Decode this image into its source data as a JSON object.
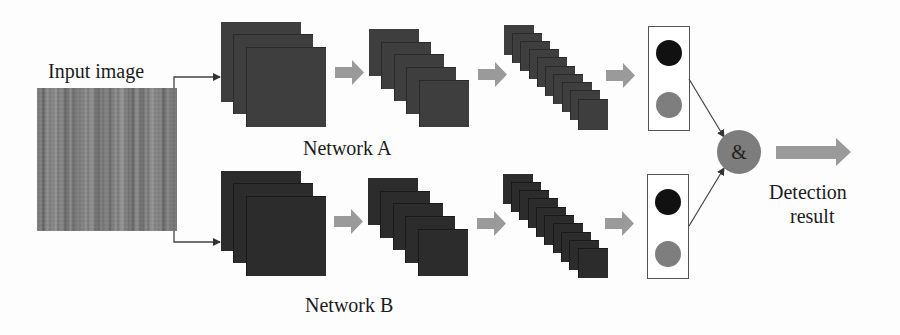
{
  "diagram": {
    "input": {
      "label": "Input image",
      "texture": "wood-grain grayscale"
    },
    "networks": [
      {
        "name": "Network A",
        "feature_stages": [
          {
            "maps": 3,
            "size": 80,
            "offset": 12
          },
          {
            "maps": 5,
            "size": 50,
            "offset": 12.5
          },
          {
            "maps": 10,
            "size": 30,
            "offset": 8.2
          }
        ],
        "output_nodes": [
          "class-1",
          "class-2"
        ]
      },
      {
        "name": "Network B",
        "feature_stages": [
          {
            "maps": 3,
            "size": 80,
            "offset": 12
          },
          {
            "maps": 5,
            "size": 50,
            "offset": 12.5
          },
          {
            "maps": 10,
            "size": 30,
            "offset": 8.2
          }
        ],
        "output_nodes": [
          "class-1",
          "class-2"
        ]
      }
    ],
    "fusion": {
      "symbol": "&"
    },
    "result": {
      "line1": "Detection",
      "line2": "result"
    }
  },
  "colors": {
    "feature_map_a": "#3e3e3e",
    "feature_map_b": "#2c2c2c",
    "stage_arrow": "#9a9a9a",
    "output_dot_dark": "#111111",
    "output_dot_light": "#7e7e7e",
    "fusion_node": "#7d7d7d",
    "connector": "#444444"
  }
}
